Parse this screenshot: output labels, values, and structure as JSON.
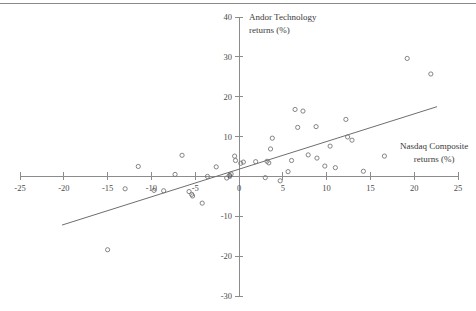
{
  "figure": {
    "background_color": "#ffffff",
    "axis_color": "#8c8c8c",
    "marker_color": "#777777",
    "trend_color": "#6e6e6e",
    "top_rule": true
  },
  "chart_data": {
    "type": "scatter",
    "title": "",
    "xlabel": "Nasdaq Composite returns (%)",
    "ylabel": "Andor Technology returns (%)",
    "xlim": [
      -25,
      25
    ],
    "ylim": [
      -30,
      40
    ],
    "xticks": [
      -25,
      -20,
      -15,
      -10,
      -5,
      0,
      5,
      10,
      15,
      20,
      25
    ],
    "xtick_labels": [
      "-25",
      "-20",
      "-15",
      "-10",
      "-5",
      "0",
      "5",
      "10",
      "15",
      "20",
      "25"
    ],
    "yticks": [
      40,
      30,
      20,
      10,
      0,
      -10,
      -20,
      -30
    ],
    "ytick_labels": [
      "40",
      "30",
      "20",
      "10",
      "0",
      "-10",
      "-20",
      "-30"
    ],
    "grid": false,
    "legend": null,
    "axes_style": "crossed-at-origin",
    "points": [
      [
        -15.0,
        -18.4
      ],
      [
        -13.0,
        -3.1
      ],
      [
        -11.5,
        2.5
      ],
      [
        -9.7,
        -3.5
      ],
      [
        -8.6,
        -3.6
      ],
      [
        -7.3,
        0.5
      ],
      [
        -6.5,
        5.3
      ],
      [
        -5.7,
        -3.8
      ],
      [
        -5.4,
        -4.5
      ],
      [
        -5.3,
        -4.9
      ],
      [
        -4.2,
        -6.7
      ],
      [
        -3.6,
        0.0
      ],
      [
        -2.6,
        2.4
      ],
      [
        -1.4,
        -0.4
      ],
      [
        -1.1,
        0.2
      ],
      [
        -0.9,
        0.6
      ],
      [
        -0.5,
        5.1
      ],
      [
        -0.4,
        4.0
      ],
      [
        0.2,
        3.3
      ],
      [
        0.5,
        3.6
      ],
      [
        1.9,
        3.7
      ],
      [
        3.0,
        -0.3
      ],
      [
        3.2,
        3.8
      ],
      [
        3.4,
        3.4
      ],
      [
        3.6,
        6.9
      ],
      [
        3.8,
        9.6
      ],
      [
        4.7,
        -1.1
      ],
      [
        5.6,
        1.2
      ],
      [
        6.0,
        4.0
      ],
      [
        6.4,
        16.8
      ],
      [
        6.7,
        12.3
      ],
      [
        7.3,
        16.4
      ],
      [
        7.9,
        5.4
      ],
      [
        8.8,
        12.5
      ],
      [
        8.9,
        4.6
      ],
      [
        9.8,
        2.6
      ],
      [
        10.4,
        7.6
      ],
      [
        11.0,
        2.2
      ],
      [
        12.2,
        14.3
      ],
      [
        12.4,
        9.9
      ],
      [
        12.9,
        9.1
      ],
      [
        14.2,
        1.3
      ],
      [
        19.2,
        29.6
      ],
      [
        21.9,
        25.7
      ]
    ],
    "trend_line": {
      "visible": true,
      "x_start": -20.2,
      "y_start": -12.2,
      "x_end": 22.6,
      "y_end": 17.5
    },
    "legend_marker": {
      "x": 16.6,
      "y": 5.1
    }
  }
}
